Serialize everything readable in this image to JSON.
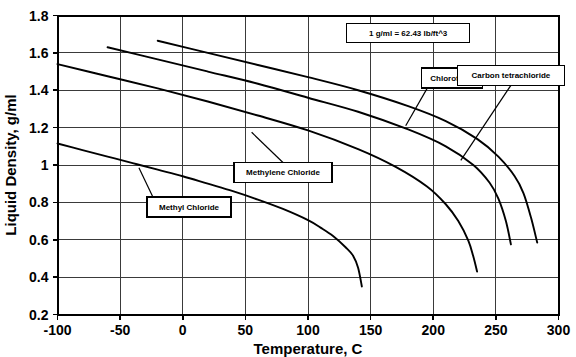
{
  "chart_data": {
    "type": "line",
    "title": "",
    "xlabel": "Temperature, C",
    "ylabel": "Liquid Density, g/ml",
    "xlim": [
      -100,
      300
    ],
    "ylim": [
      0.2,
      1.8
    ],
    "xticks": [
      -100,
      -50,
      0,
      50,
      100,
      150,
      200,
      250,
      300
    ],
    "yticks": [
      0.2,
      0.4,
      0.6,
      0.8,
      1,
      1.2,
      1.4,
      1.6,
      1.8
    ],
    "xtick_labels": [
      "-100",
      "-50",
      "0",
      "50",
      "100",
      "150",
      "200",
      "250",
      "300"
    ],
    "ytick_labels": [
      "0.2",
      "0.4",
      "0.6",
      "0.8",
      "1",
      "1.2",
      "1.4",
      "1.6",
      "1.8"
    ],
    "grid": true,
    "legend_position": "none",
    "annotations": [
      {
        "name": "conversion-note",
        "text": "1 g/ml = 62.43 lb/ft^3",
        "x": 180,
        "y": 1.705
      }
    ],
    "series": [
      {
        "name": "Methyl Chloride",
        "label": "Methyl Chloride",
        "label_x": 5,
        "label_y": 0.775,
        "leader_to_x": -35,
        "leader_to_y": 0.985,
        "x": [
          -100,
          -80,
          -60,
          -40,
          -20,
          0,
          20,
          40,
          60,
          80,
          100,
          110,
          120,
          130,
          136,
          140,
          143
        ],
        "y": [
          1.115,
          1.08,
          1.045,
          1.01,
          0.975,
          0.94,
          0.9,
          0.86,
          0.815,
          0.765,
          0.705,
          0.665,
          0.62,
          0.56,
          0.515,
          0.45,
          0.35
        ]
      },
      {
        "name": "Methylene Chloride",
        "label": "Methylene Chloride",
        "label_x": 80,
        "label_y": 0.96,
        "leader_to_x": 55,
        "leader_to_y": 1.175,
        "x": [
          -100,
          -60,
          -20,
          20,
          60,
          100,
          140,
          170,
          195,
          210,
          220,
          228,
          232,
          235
        ],
        "y": [
          1.54,
          1.475,
          1.41,
          1.34,
          1.265,
          1.185,
          1.085,
          0.99,
          0.885,
          0.79,
          0.7,
          0.595,
          0.51,
          0.43
        ]
      },
      {
        "name": "Chloroform",
        "label": "Chloroform",
        "label_x": 215,
        "label_y": 1.465,
        "leader_to_x": 178,
        "leader_to_y": 1.21,
        "x": [
          -60,
          -20,
          20,
          60,
          100,
          140,
          180,
          210,
          232,
          245,
          252,
          258,
          262
        ],
        "y": [
          1.63,
          1.565,
          1.5,
          1.435,
          1.36,
          1.285,
          1.19,
          1.1,
          1.0,
          0.905,
          0.82,
          0.7,
          0.575
        ]
      },
      {
        "name": "Carbon tetrachloride",
        "label": "Carbon tetrachloride",
        "label_x": 262,
        "label_y": 1.48,
        "leader_to_x": 222,
        "leader_to_y": 1.025,
        "x": [
          -20,
          20,
          60,
          100,
          140,
          180,
          210,
          235,
          252,
          265,
          272,
          278,
          283
        ],
        "y": [
          1.665,
          1.6,
          1.535,
          1.47,
          1.4,
          1.315,
          1.235,
          1.14,
          1.045,
          0.94,
          0.85,
          0.72,
          0.585
        ]
      }
    ]
  },
  "colors": {
    "curve": "#000000",
    "grid": "#3a3a3a",
    "axis": "#000000",
    "background": "#ffffff"
  }
}
